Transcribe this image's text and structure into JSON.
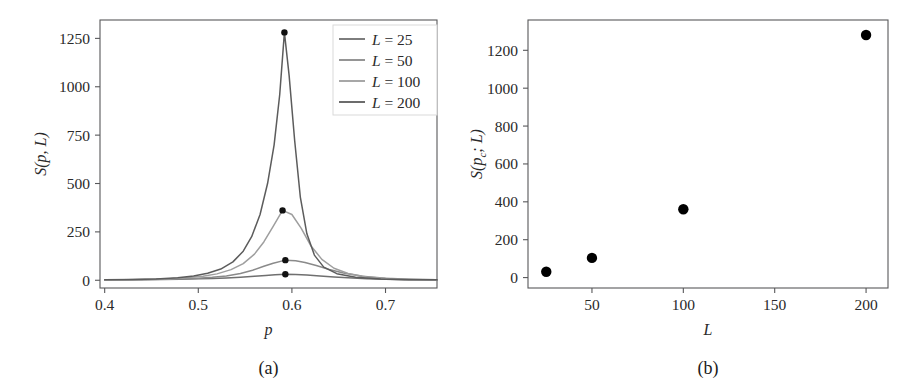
{
  "figure": {
    "panels": [
      {
        "id": "a",
        "caption": "(a)"
      },
      {
        "id": "b",
        "caption": "(b)"
      }
    ]
  },
  "chart_data": [
    {
      "panel": "a",
      "type": "line",
      "title": "",
      "xlabel": "p",
      "ylabel": "S(p, L)",
      "xlim": [
        0.395,
        0.755
      ],
      "ylim": [
        -40,
        1345
      ],
      "xticks": [
        0.4,
        0.5,
        0.6,
        0.7
      ],
      "xticklabels": [
        "0.4",
        "0.5",
        "0.6",
        "0.7"
      ],
      "yticks": [
        0,
        250,
        500,
        750,
        1000,
        1250
      ],
      "yticklabels": [
        "0",
        "250",
        "500",
        "750",
        "1000",
        "1250"
      ],
      "grid": false,
      "legend_position": "upper right",
      "series": [
        {
          "name": "L = 25",
          "label": "L = 25",
          "L": 25,
          "color": "#6f6f6f",
          "peak": {
            "p": 0.593,
            "S": 31
          },
          "x": [
            0.4,
            0.42,
            0.44,
            0.46,
            0.48,
            0.5,
            0.515,
            0.53,
            0.545,
            0.56,
            0.572,
            0.582,
            0.593,
            0.604,
            0.616,
            0.63,
            0.645,
            0.66,
            0.68,
            0.7,
            0.72,
            0.74,
            0.755
          ],
          "y": [
            2,
            2.5,
            3,
            4,
            5.5,
            7.5,
            9.5,
            12,
            16,
            21,
            25,
            28,
            31,
            30,
            27,
            22,
            17,
            13,
            8,
            5,
            3,
            2,
            1.5
          ]
        },
        {
          "name": "L = 50",
          "label": "L = 50",
          "L": 50,
          "color": "#8a8a8a",
          "peak": {
            "p": 0.593,
            "S": 104
          },
          "x": [
            0.4,
            0.42,
            0.44,
            0.46,
            0.48,
            0.5,
            0.515,
            0.53,
            0.545,
            0.558,
            0.57,
            0.58,
            0.593,
            0.604,
            0.614,
            0.626,
            0.64,
            0.655,
            0.675,
            0.7,
            0.72,
            0.74,
            0.755
          ],
          "y": [
            2,
            2.5,
            3.5,
            5,
            7,
            11,
            15,
            22,
            35,
            52,
            72,
            88,
            104,
            101,
            92,
            76,
            56,
            38,
            21,
            10,
            6,
            3.5,
            2.5
          ]
        },
        {
          "name": "L = 100",
          "label": "L = 100",
          "L": 100,
          "color": "#9e9e9e",
          "peak": {
            "p": 0.59,
            "S": 361
          },
          "x": [
            0.4,
            0.425,
            0.45,
            0.47,
            0.49,
            0.505,
            0.52,
            0.535,
            0.548,
            0.56,
            0.57,
            0.58,
            0.59,
            0.6,
            0.61,
            0.62,
            0.632,
            0.645,
            0.66,
            0.68,
            0.705,
            0.73,
            0.755
          ],
          "y": [
            2,
            3,
            5,
            8,
            14,
            21,
            33,
            55,
            86,
            135,
            198,
            278,
            361,
            340,
            268,
            180,
            108,
            62,
            35,
            17,
            8,
            4,
            2
          ]
        },
        {
          "name": "L = 200",
          "label": "L = 200",
          "L": 200,
          "color": "#5c5c5c",
          "peak": {
            "p": 0.592,
            "S": 1281
          },
          "x": [
            0.4,
            0.43,
            0.455,
            0.478,
            0.495,
            0.51,
            0.524,
            0.537,
            0.548,
            0.557,
            0.566,
            0.574,
            0.581,
            0.587,
            0.592,
            0.597,
            0.603,
            0.609,
            0.616,
            0.624,
            0.634,
            0.648,
            0.668,
            0.695,
            0.725,
            0.755
          ],
          "y": [
            2,
            4,
            7,
            13,
            22,
            36,
            58,
            95,
            150,
            225,
            340,
            500,
            700,
            960,
            1281,
            1060,
            720,
            430,
            240,
            130,
            68,
            34,
            15,
            7,
            3,
            2
          ]
        }
      ]
    },
    {
      "panel": "b",
      "type": "scatter",
      "title": "",
      "xlabel": "L",
      "ylabel": "S(pc; L)",
      "xlim": [
        15,
        212
      ],
      "ylim": [
        -55,
        1360
      ],
      "xticks": [
        50,
        100,
        150,
        200
      ],
      "xticklabels": [
        "50",
        "100",
        "150",
        "200"
      ],
      "yticks": [
        0,
        200,
        400,
        600,
        800,
        1000,
        1200
      ],
      "yticklabels": [
        "0",
        "200",
        "400",
        "600",
        "800",
        "1000",
        "1200"
      ],
      "grid": false,
      "x": [
        25,
        50,
        100,
        200
      ],
      "y": [
        31,
        104,
        361,
        1281
      ],
      "marker": "o",
      "marker_color": "#000000"
    }
  ]
}
